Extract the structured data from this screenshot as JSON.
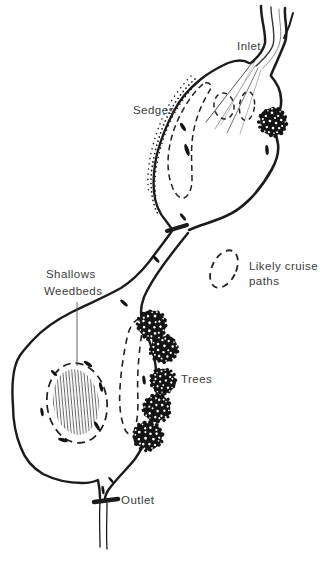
{
  "map": {
    "background": "#ffffff",
    "ink_color": "#1b1b1b",
    "label_color": "#3c3c3c",
    "labels": {
      "inlet": "Inlet",
      "sedges": "Sedges",
      "cruise_line1": "Likely cruise",
      "cruise_line2": "paths",
      "shallows_line1": "Shallows",
      "shallows_line2": "Weedbeds",
      "trees": "Trees",
      "outlet": "Outlet"
    }
  }
}
